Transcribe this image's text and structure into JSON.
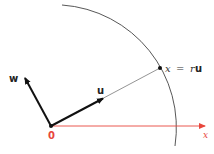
{
  "diagram": {
    "labels": {
      "w": "w",
      "u": "u",
      "origin": "0",
      "x_axis": "x",
      "point_eq_lhs": "x",
      "point_eq_op": "=",
      "point_eq_r": "r",
      "point_eq_u": "u"
    },
    "colors": {
      "axis": "#e8463c",
      "vector": "#111111",
      "arc": "#444444",
      "line": "#666666"
    }
  }
}
